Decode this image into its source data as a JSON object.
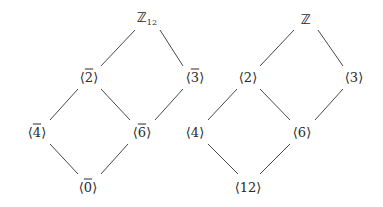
{
  "diagram": {
    "left_lattice": {
      "nodes": [
        {
          "id": "Z12",
          "label": "ℤ",
          "sub": "12",
          "x": 147,
          "y": 19
        },
        {
          "id": "b2",
          "label": "2",
          "bar": true,
          "x": 89,
          "y": 77
        },
        {
          "id": "b3",
          "label": "3",
          "bar": true,
          "x": 195,
          "y": 77
        },
        {
          "id": "b4",
          "label": "4",
          "bar": true,
          "x": 37,
          "y": 132
        },
        {
          "id": "b6",
          "label": "6",
          "bar": true,
          "x": 142,
          "y": 132
        },
        {
          "id": "b0",
          "label": "0",
          "bar": true,
          "x": 88,
          "y": 187
        }
      ],
      "edges": [
        [
          "Z12",
          "b2"
        ],
        [
          "Z12",
          "b3"
        ],
        [
          "b2",
          "b4"
        ],
        [
          "b2",
          "b6"
        ],
        [
          "b3",
          "b6"
        ],
        [
          "b4",
          "b0"
        ],
        [
          "b6",
          "b0"
        ]
      ]
    },
    "right_lattice": {
      "nodes": [
        {
          "id": "Z",
          "label": "ℤ",
          "x": 306,
          "y": 19
        },
        {
          "id": "n2",
          "label": "2",
          "x": 248,
          "y": 77
        },
        {
          "id": "n3",
          "label": "3",
          "x": 354,
          "y": 77
        },
        {
          "id": "n4",
          "label": "4",
          "x": 195,
          "y": 132
        },
        {
          "id": "n6",
          "label": "6",
          "x": 302,
          "y": 132
        },
        {
          "id": "n12",
          "label": "12",
          "x": 248,
          "y": 187
        }
      ],
      "edges": [
        [
          "Z",
          "n2"
        ],
        [
          "Z",
          "n3"
        ],
        [
          "n2",
          "n4"
        ],
        [
          "n2",
          "n6"
        ],
        [
          "n3",
          "n6"
        ],
        [
          "n4",
          "n12"
        ],
        [
          "n6",
          "n12"
        ]
      ]
    },
    "line_color": "#333333"
  }
}
